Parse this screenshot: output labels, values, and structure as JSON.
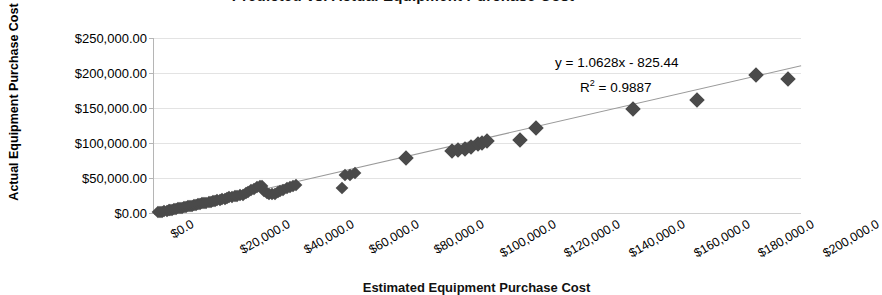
{
  "chart_data": {
    "type": "scatter",
    "title": "Predicted vs. Actual Equipment Purchase Cost",
    "xlabel": "Estimated Equipment Purchase Cost",
    "ylabel": "Actual Equipment Purchase Cost",
    "xlim": [
      0,
      200000
    ],
    "ylim": [
      0,
      250000
    ],
    "xticks": [
      0,
      20000,
      40000,
      60000,
      80000,
      100000,
      120000,
      140000,
      160000,
      180000,
      200000
    ],
    "xtick_labels": [
      "$0.0",
      "$20,000.0",
      "$40,000.0",
      "$60,000.0",
      "$80,000.0",
      "$100,000.0",
      "$120,000.0",
      "$140,000.0",
      "$160,000.0",
      "$180,000.0",
      "$200,000.0"
    ],
    "yticks": [
      0,
      50000,
      100000,
      150000,
      200000,
      250000
    ],
    "ytick_labels": [
      "$0.00",
      "$50,000.00",
      "$100,000.00",
      "$150,000.00",
      "$200,000.00",
      "$250,000.00"
    ],
    "grid": true,
    "legend": false,
    "marker": "diamond",
    "marker_color": "#4a4a4a",
    "trendline_color": "#9a9a9a",
    "annotations": [
      {
        "id": "equation",
        "text": "y = 1.0628x - 825.44"
      },
      {
        "id": "r_squared",
        "text": "R2 = 0.9887",
        "display_base": "R",
        "display_exp": "2",
        "display_tail": " = 0.9887"
      }
    ],
    "trendline": {
      "slope": 1.0628,
      "intercept": -825.44,
      "r_squared": 0.9887
    },
    "points": [
      [
        1200,
        900
      ],
      [
        2000,
        1500
      ],
      [
        2600,
        2100
      ],
      [
        3200,
        2600
      ],
      [
        3900,
        3200
      ],
      [
        4500,
        3800
      ],
      [
        5100,
        4300
      ],
      [
        5700,
        4900
      ],
      [
        6300,
        5500
      ],
      [
        6900,
        6000
      ],
      [
        7500,
        6600
      ],
      [
        8100,
        7200
      ],
      [
        8700,
        7800
      ],
      [
        9300,
        8300
      ],
      [
        9900,
        8900
      ],
      [
        10500,
        9500
      ],
      [
        11200,
        10100
      ],
      [
        11800,
        10700
      ],
      [
        12400,
        11300
      ],
      [
        13000,
        11900
      ],
      [
        13600,
        12400
      ],
      [
        14300,
        13000
      ],
      [
        14900,
        13600
      ],
      [
        15600,
        14300
      ],
      [
        16200,
        14900
      ],
      [
        16900,
        15600
      ],
      [
        17600,
        16300
      ],
      [
        18200,
        16900
      ],
      [
        18900,
        17600
      ],
      [
        19600,
        18300
      ],
      [
        20300,
        19000
      ],
      [
        21000,
        19800
      ],
      [
        21800,
        20600
      ],
      [
        22500,
        21400
      ],
      [
        23300,
        22200
      ],
      [
        24100,
        23000
      ],
      [
        24900,
        23800
      ],
      [
        25700,
        24600
      ],
      [
        26600,
        25500
      ],
      [
        27400,
        26300
      ],
      [
        28300,
        28500
      ],
      [
        29200,
        30500
      ],
      [
        30100,
        32500
      ],
      [
        31000,
        34500
      ],
      [
        31900,
        36500
      ],
      [
        32800,
        38000
      ],
      [
        33400,
        39000
      ],
      [
        34100,
        31000
      ],
      [
        34800,
        29000
      ],
      [
        35600,
        27500
      ],
      [
        36400,
        26500
      ],
      [
        37300,
        27500
      ],
      [
        38200,
        29500
      ],
      [
        39100,
        31500
      ],
      [
        40000,
        33500
      ],
      [
        41000,
        35500
      ],
      [
        42000,
        37500
      ],
      [
        43000,
        39000
      ],
      [
        44000,
        40500
      ],
      [
        58000,
        36000
      ],
      [
        59000,
        54000
      ],
      [
        60500,
        55000
      ],
      [
        62000,
        56500
      ],
      [
        78000,
        79000
      ],
      [
        92000,
        88000
      ],
      [
        94000,
        90000
      ],
      [
        96000,
        92000
      ],
      [
        98000,
        95000
      ],
      [
        100000,
        98000
      ],
      [
        101500,
        100500
      ],
      [
        103000,
        103000
      ],
      [
        113000,
        105000
      ],
      [
        118000,
        122000
      ],
      [
        148000,
        148000
      ],
      [
        168000,
        161000
      ],
      [
        186000,
        197000
      ],
      [
        196000,
        192000
      ]
    ]
  }
}
